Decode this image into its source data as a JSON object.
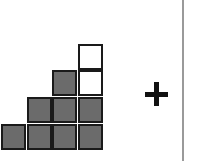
{
  "diagram": {
    "colors": {
      "filled": "#6b6b6b",
      "empty": "#ffffff",
      "border": "#1a1a1a",
      "divider": "#9a9a9a"
    },
    "grid": {
      "columns_x": [
        1,
        27,
        52,
        78
      ],
      "rows_y": [
        44,
        70,
        97,
        124
      ],
      "cells": [
        {
          "row": 0,
          "col": 3,
          "fill": "empty"
        },
        {
          "row": 1,
          "col": 2,
          "fill": "filled"
        },
        {
          "row": 1,
          "col": 3,
          "fill": "empty"
        },
        {
          "row": 2,
          "col": 1,
          "fill": "filled"
        },
        {
          "row": 2,
          "col": 2,
          "fill": "filled"
        },
        {
          "row": 2,
          "col": 3,
          "fill": "filled"
        },
        {
          "row": 3,
          "col": 0,
          "fill": "filled"
        },
        {
          "row": 3,
          "col": 1,
          "fill": "filled"
        },
        {
          "row": 3,
          "col": 2,
          "fill": "filled"
        },
        {
          "row": 3,
          "col": 3,
          "fill": "filled"
        }
      ]
    },
    "operator": "plus-icon"
  }
}
